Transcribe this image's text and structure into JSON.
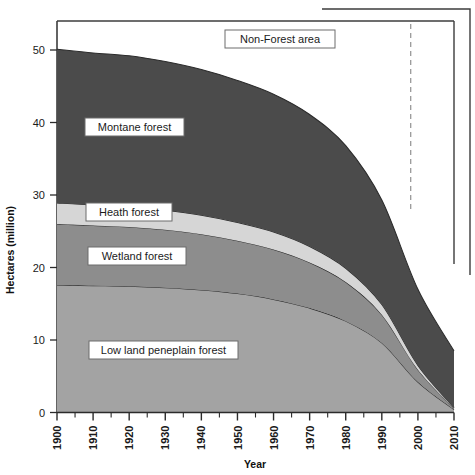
{
  "chart_data": {
    "type": "area",
    "title": "",
    "xlabel": "Year",
    "ylabel": "Hectares (million)",
    "xlim": [
      1900,
      2010
    ],
    "ylim": [
      0,
      54
    ],
    "grid": false,
    "legend_position": "inline-labels",
    "stacked": true,
    "x": [
      1900,
      1910,
      1920,
      1930,
      1940,
      1950,
      1960,
      1970,
      1980,
      1990,
      2000,
      2010
    ],
    "series": [
      {
        "name": "Low land peneplain forest",
        "color": "#a3a3a3",
        "values": [
          17.6,
          17.5,
          17.4,
          17.2,
          16.9,
          16.4,
          15.6,
          14.4,
          12.6,
          9.6,
          4.2,
          0.4
        ]
      },
      {
        "name": "Wetland forest",
        "color": "#8d8d8d",
        "values": [
          8.4,
          8.3,
          8.2,
          8.0,
          7.7,
          7.3,
          6.9,
          6.3,
          5.4,
          3.9,
          1.7,
          0.2
        ]
      },
      {
        "name": "Heath forest",
        "color": "#d6d6d6",
        "values": [
          2.9,
          2.8,
          2.8,
          2.7,
          2.6,
          2.5,
          2.4,
          2.2,
          1.9,
          1.4,
          0.6,
          0.1
        ]
      },
      {
        "name": "Montane forest",
        "color": "#4b4b4b",
        "values": [
          21.2,
          21.0,
          20.8,
          20.5,
          20.1,
          19.6,
          19.0,
          18.2,
          16.9,
          14.4,
          10.5,
          7.8
        ]
      }
    ],
    "totals": [
      50.1,
      49.6,
      49.2,
      48.4,
      47.3,
      45.8,
      43.9,
      41.1,
      36.8,
      29.3,
      17.0,
      8.5
    ],
    "non_forest_label": "Non-Forest area",
    "y_ticks": [
      0,
      10,
      20,
      30,
      40,
      50
    ],
    "x_ticks": [
      1900,
      1910,
      1920,
      1930,
      1940,
      1950,
      1960,
      1970,
      1980,
      1990,
      2000,
      2010
    ],
    "x_minor_ticks": [
      1905,
      1915,
      1925,
      1935,
      1945,
      1955,
      1965,
      1975,
      1985,
      1995,
      2005
    ],
    "reference_line": {
      "x": 1998,
      "style": "dashed",
      "color": "#9a9a9a"
    }
  },
  "axes": {
    "y_title": "Hectares (million)",
    "x_title": "Year",
    "y_tick_labels": [
      "0",
      "10",
      "20",
      "30",
      "40",
      "50"
    ],
    "x_tick_labels": [
      "1900",
      "1910",
      "1920",
      "1930",
      "1940",
      "1950",
      "1960",
      "1970",
      "1980",
      "1990",
      "2000",
      "2010"
    ]
  },
  "labels": {
    "non_forest": "Non-Forest area",
    "montane": "Montane forest",
    "heath": "Heath forest",
    "wetland": "Wetland forest",
    "lowland": "Low land peneplain forest"
  },
  "colors": {
    "montane": "#4b4b4b",
    "heath": "#d6d6d6",
    "wetland": "#8d8d8d",
    "lowland": "#a3a3a3",
    "non_forest": "#ffffff",
    "frame": "#3c3c3c",
    "outline": "#2b2b2b",
    "dashed": "#9a9a9a"
  }
}
